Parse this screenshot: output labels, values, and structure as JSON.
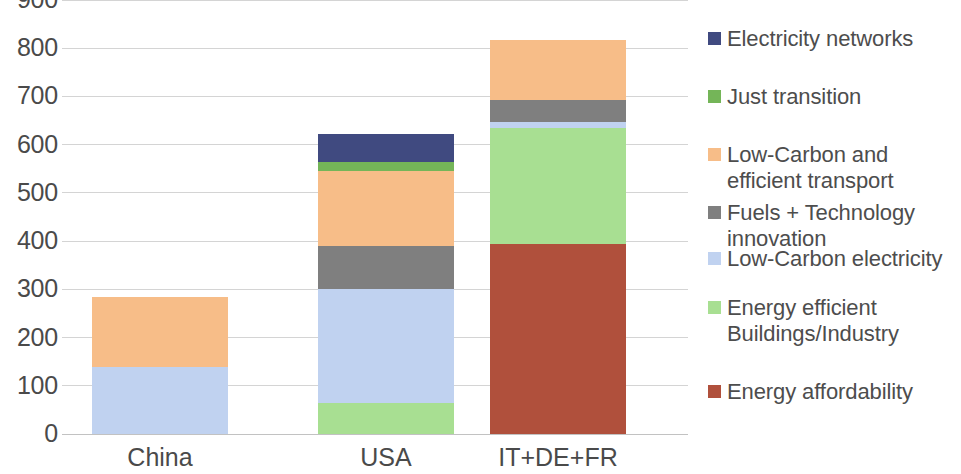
{
  "chart_data": {
    "type": "bar",
    "subtype": "stacked",
    "title": "",
    "xlabel": "",
    "ylabel": "",
    "categories": [
      "China",
      "USA",
      "IT+DE+FR"
    ],
    "ylim": [
      0,
      900
    ],
    "y_ticks": [
      0,
      100,
      200,
      300,
      400,
      500,
      600,
      700,
      800,
      900
    ],
    "y_tick_labels": [
      "0",
      "100",
      "200",
      "300",
      "400",
      "500",
      "600",
      "700",
      "800",
      "900"
    ],
    "grid": true,
    "grid_axis": "y",
    "legend_position": "right",
    "series": [
      {
        "name": "Energy affordability",
        "color": "#b0503c",
        "values": [
          0,
          0,
          395
        ]
      },
      {
        "name": "Energy efficient Buildings/Industry",
        "color": "#a8df92",
        "values": [
          0,
          65,
          240
        ]
      },
      {
        "name": "Low-Carbon electricity",
        "color": "#c0d2f0",
        "values": [
          140,
          235,
          13
        ]
      },
      {
        "name": "Fuels + Technology innovation",
        "color": "#7f7f7f",
        "values": [
          0,
          90,
          44
        ]
      },
      {
        "name": "Low-Carbon and efficient transport",
        "color": "#f7bd88",
        "values": [
          145,
          155,
          125
        ]
      },
      {
        "name": "Just transition",
        "color": "#74b558",
        "values": [
          0,
          20,
          0
        ]
      },
      {
        "name": "Electricity networks",
        "color": "#404a80",
        "values": [
          0,
          57,
          0
        ]
      }
    ],
    "totals": [
      285,
      592,
      795
    ]
  },
  "legend": {
    "items": [
      {
        "label": "Electricity networks",
        "color": "#404a80"
      },
      {
        "label": "Just transition",
        "color": "#74b558"
      },
      {
        "label": "Low-Carbon and\nefficient transport",
        "color": "#f7bd88"
      },
      {
        "label": "Fuels + Technology\ninnovation",
        "color": "#7f7f7f"
      },
      {
        "label": "Low-Carbon electricity",
        "color": "#c0d2f0"
      },
      {
        "label": "Energy efficient\nBuildings/Industry",
        "color": "#a8df92"
      },
      {
        "label": "Energy affordability",
        "color": "#b0503c"
      }
    ]
  },
  "colors": {
    "gridline": "#d4d4d4",
    "axis_text": "#4a4a4a",
    "legend_text": "#4d4d4d",
    "background": "#ffffff"
  }
}
